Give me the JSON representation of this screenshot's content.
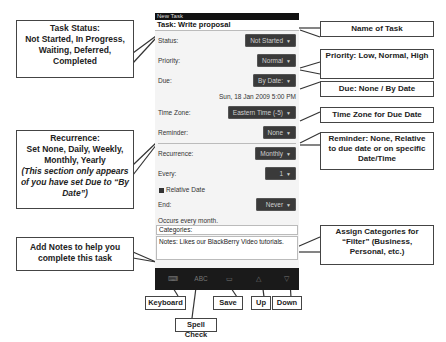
{
  "phone": {
    "window_title": "New Task",
    "task_name": "Task: Write proposal",
    "fields": {
      "status": {
        "label": "Status:",
        "value": "Not Started"
      },
      "priority": {
        "label": "Priority:",
        "value": "Normal"
      },
      "due": {
        "label": "Due:",
        "value": "By Date:"
      },
      "due_datetime": "Sun, 18 Jan 2009 5:00 PM",
      "timezone": {
        "label": "Time Zone:",
        "value": "Eastern Time (-5)"
      },
      "reminder": {
        "label": "Reminder:",
        "value": "None"
      },
      "recurrence": {
        "label": "Recurrence:",
        "value": "Monthly"
      },
      "every": {
        "label": "Every:",
        "value": "1"
      },
      "relative_date": "Relative Date",
      "end": {
        "label": "End:",
        "value": "Never"
      },
      "occurs": "Occurs every month.",
      "categories": "Categories:",
      "notes": "Notes: Likes our BlackBerry Video tutorials."
    },
    "arrow_glyph": "▼",
    "toolbar": {
      "keyboard": "⌨",
      "spellcheck": "ABC",
      "save": "▭",
      "up": "△",
      "down": "▽"
    }
  },
  "callouts": {
    "task_status": {
      "title": "Task Status:",
      "body": "Not Started, In Progress, Waiting, Deferred, Completed"
    },
    "recurrence": {
      "title": "Recurrence:",
      "body": "Set None, Daily, Weekly, Monthly, Yearly",
      "note": "(This section only appears of you have set Due to “By Date”)"
    },
    "notes": "Add Notes to help you complete this task",
    "name_of_task": "Name of Task",
    "priority": "Priority: Low, Normal, High",
    "due": "Due: None / By Date",
    "timezone": "Time Zone for Due Date",
    "reminder": "Reminder: None, Relative to due date or on specific Date/Time",
    "categories": "Assign Categories for “Filter” (Business, Personal, etc.)",
    "keyboard": "Keyboard",
    "spellcheck": "Spell Check",
    "save": "Save",
    "up": "Up",
    "down": "Down"
  }
}
